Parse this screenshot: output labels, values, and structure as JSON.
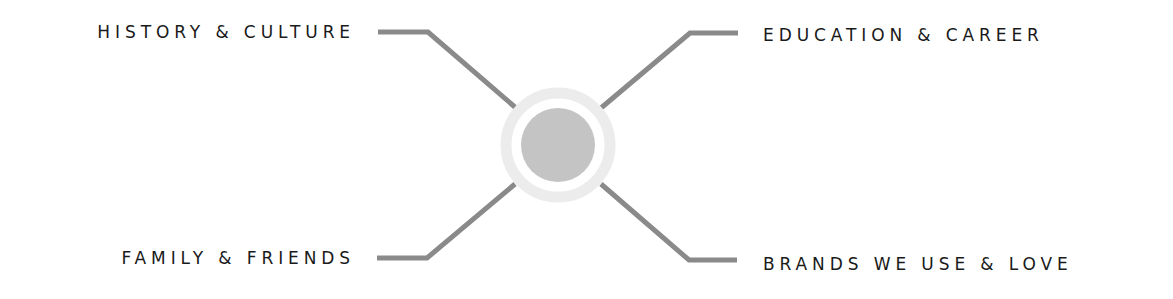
{
  "diagram": {
    "type": "radial-four-branch",
    "center": {
      "shape": "circle",
      "outer_ring_color": "#ececec",
      "inner_fill_color": "#c4c4c4"
    },
    "connector_color": "#8a8a8a",
    "branches": [
      {
        "position": "top-left",
        "label": "HISTORY & CULTURE"
      },
      {
        "position": "top-right",
        "label": "EDUCATION & CAREER"
      },
      {
        "position": "bottom-left",
        "label": "FAMILY & FRIENDS"
      },
      {
        "position": "bottom-right",
        "label": "BRANDS WE USE & LOVE"
      }
    ]
  }
}
